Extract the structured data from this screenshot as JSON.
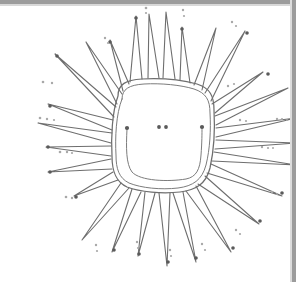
{
  "document": {
    "kind": "scanned-line-drawing",
    "title": "Spiky sun blob line drawing",
    "width": 299,
    "height": 282,
    "background_color": "#ffffff"
  },
  "edges": {
    "top_band_color": "#9c9c9c",
    "top_band_highlight": "#d8d8d8",
    "right_band_color": "#9c9c9c",
    "right_band_highlight": "#dcdcdc",
    "left_band": "none",
    "bottom_band": "none"
  },
  "ink": {
    "primary_color": "#6e6e6e",
    "secondary_color": "#7c7c7c",
    "dot_color": "#5a5a5a",
    "dot_faint_color": "#a8a8a8"
  },
  "drawing": {
    "subject": "sun-like spiky blob",
    "body": {
      "shape": "rounded square (squircle)",
      "outline_style": "double contour",
      "center_x": 155,
      "center_y": 140,
      "outer_path": "M 118 96 C 118 84, 126 80, 142 79 C 160 78, 182 80, 197 84 C 210 88, 214 96, 214 110 C 215 128, 214 150, 210 168 C 206 184, 196 190, 180 192 C 162 194, 140 192, 127 187 C 116 182, 112 172, 112 156 C 111 138, 112 112, 118 96 Z",
      "inner_path": "M 122 99 C 122 89, 129 85, 144 84 C 161 83, 181 85, 194 89 C 206 93, 210 100, 210 113 C 211 129, 210 149, 206 165 C 202 180, 193 186, 178 188 C 161 190, 141 188, 129 183 C 119 178, 116 169, 116 155 C 115 138, 116 114, 122 99 Z"
    },
    "inner_curve": {
      "description": "U-shaped mouth line with dotted terminals",
      "path": "M 127 129 C 126 148, 126 164, 132 172 C 140 181, 168 182, 186 179 C 196 177, 200 170, 201 155 C 202 142, 202 133, 202 128",
      "left_terminal": {
        "x": 127,
        "y": 128,
        "r": 2.1
      },
      "right_terminal": {
        "x": 202,
        "y": 127,
        "r": 2.1
      }
    },
    "center_dots": [
      {
        "x": 159,
        "y": 127,
        "r": 1.9
      },
      {
        "x": 166,
        "y": 127,
        "r": 1.9
      }
    ],
    "spike_count": 24,
    "spikes": [
      {
        "name": "spike-n-1",
        "base_a": [
          130,
          82
        ],
        "base_b": [
          142,
          79
        ],
        "tip": [
          136,
          16
        ]
      },
      {
        "name": "spike-n-2",
        "base_a": [
          148,
          78
        ],
        "base_b": [
          159,
          78
        ],
        "tip": [
          149,
          14
        ]
      },
      {
        "name": "spike-n-3",
        "base_a": [
          163,
          78
        ],
        "base_b": [
          175,
          79
        ],
        "tip": [
          166,
          12
        ]
      },
      {
        "name": "spike-ne-1",
        "base_a": [
          180,
          80
        ],
        "base_b": [
          190,
          83
        ],
        "tip": [
          182,
          27
        ]
      },
      {
        "name": "spike-ne-2",
        "base_a": [
          194,
          85
        ],
        "base_b": [
          202,
          90
        ],
        "tip": [
          216,
          28
        ]
      },
      {
        "name": "spike-ne-3",
        "base_a": [
          205,
          93
        ],
        "base_b": [
          211,
          101
        ],
        "tip": [
          245,
          31
        ]
      },
      {
        "name": "spike-ne-4",
        "base_a": [
          212,
          104
        ],
        "base_b": [
          215,
          113
        ],
        "tip": [
          263,
          72
        ]
      },
      {
        "name": "spike-e-1",
        "base_a": [
          215,
          116
        ],
        "base_b": [
          216,
          125
        ],
        "tip": [
          288,
          88
        ]
      },
      {
        "name": "spike-e-2",
        "base_a": [
          216,
          128
        ],
        "base_b": [
          216,
          137
        ],
        "tip": [
          296,
          118
        ]
      },
      {
        "name": "spike-e-3",
        "base_a": [
          216,
          140
        ],
        "base_b": [
          215,
          149
        ],
        "tip": [
          296,
          143
        ]
      },
      {
        "name": "spike-e-4",
        "base_a": [
          214,
          152
        ],
        "base_b": [
          212,
          161
        ],
        "tip": [
          296,
          165
        ]
      },
      {
        "name": "spike-se-1",
        "base_a": [
          211,
          164
        ],
        "base_b": [
          207,
          173
        ],
        "tip": [
          282,
          196
        ]
      },
      {
        "name": "spike-se-2",
        "base_a": [
          205,
          176
        ],
        "base_b": [
          198,
          184
        ],
        "tip": [
          259,
          224
        ]
      },
      {
        "name": "spike-se-3",
        "base_a": [
          196,
          186
        ],
        "base_b": [
          186,
          191
        ],
        "tip": [
          231,
          252
        ]
      },
      {
        "name": "spike-s-1",
        "base_a": [
          183,
          192
        ],
        "base_b": [
          173,
          193
        ],
        "tip": [
          196,
          262
        ]
      },
      {
        "name": "spike-s-2",
        "base_a": [
          170,
          193
        ],
        "base_b": [
          159,
          193
        ],
        "tip": [
          167,
          266
        ]
      },
      {
        "name": "spike-s-3",
        "base_a": [
          155,
          193
        ],
        "base_b": [
          145,
          192
        ],
        "tip": [
          138,
          256
        ]
      },
      {
        "name": "spike-sw-1",
        "base_a": [
          141,
          192
        ],
        "base_b": [
          132,
          189
        ],
        "tip": [
          112,
          252
        ]
      },
      {
        "name": "spike-sw-2",
        "base_a": [
          129,
          188
        ],
        "base_b": [
          121,
          183
        ],
        "tip": [
          82,
          240
        ]
      },
      {
        "name": "spike-sw-3",
        "base_a": [
          118,
          180
        ],
        "base_b": [
          113,
          172
        ],
        "tip": [
          74,
          196
        ]
      },
      {
        "name": "spike-w-1",
        "base_a": [
          112,
          169
        ],
        "base_b": [
          111,
          159
        ],
        "tip": [
          48,
          172
        ]
      },
      {
        "name": "spike-w-2",
        "base_a": [
          111,
          156
        ],
        "base_b": [
          111,
          146
        ],
        "tip": [
          46,
          147
        ]
      },
      {
        "name": "spike-w-3",
        "base_a": [
          111,
          143
        ],
        "base_b": [
          112,
          133
        ],
        "tip": [
          38,
          123
        ]
      },
      {
        "name": "spike-w-4",
        "base_a": [
          112,
          130
        ],
        "base_b": [
          113,
          120
        ],
        "tip": [
          48,
          104
        ]
      },
      {
        "name": "spike-nw-1",
        "base_a": [
          114,
          117
        ],
        "base_b": [
          116,
          107
        ],
        "tip": [
          55,
          54
        ]
      },
      {
        "name": "spike-nw-2",
        "base_a": [
          117,
          104
        ],
        "base_b": [
          122,
          94
        ],
        "tip": [
          86,
          42
        ]
      },
      {
        "name": "spike-nw-3",
        "base_a": [
          123,
          91
        ],
        "base_b": [
          129,
          84
        ],
        "tip": [
          110,
          40
        ]
      }
    ],
    "tip_dots": [
      {
        "x": 136,
        "y": 18,
        "r": 1.8
      },
      {
        "x": 182,
        "y": 29,
        "r": 1.8
      },
      {
        "x": 110,
        "y": 42,
        "r": 1.8
      },
      {
        "x": 57,
        "y": 56,
        "r": 1.8
      },
      {
        "x": 50,
        "y": 106,
        "r": 1.8
      },
      {
        "x": 48,
        "y": 147,
        "r": 1.8
      },
      {
        "x": 50,
        "y": 172,
        "r": 1.8
      },
      {
        "x": 76,
        "y": 197,
        "r": 1.8
      },
      {
        "x": 114,
        "y": 250,
        "r": 1.8
      },
      {
        "x": 139,
        "y": 254,
        "r": 1.8
      },
      {
        "x": 168,
        "y": 262,
        "r": 1.8
      },
      {
        "x": 196,
        "y": 258,
        "r": 1.8
      },
      {
        "x": 233,
        "y": 248,
        "r": 1.8
      },
      {
        "x": 260,
        "y": 221,
        "r": 1.8
      },
      {
        "x": 282,
        "y": 193,
        "r": 1.8
      },
      {
        "x": 268,
        "y": 74,
        "r": 1.8
      },
      {
        "x": 247,
        "y": 33,
        "r": 1.8
      }
    ],
    "scatter_dots": [
      {
        "x": 146,
        "y": 8,
        "r": 1.3
      },
      {
        "x": 146,
        "y": 13,
        "r": 1.1
      },
      {
        "x": 183,
        "y": 10,
        "r": 1.2
      },
      {
        "x": 184,
        "y": 16,
        "r": 1.1
      },
      {
        "x": 105,
        "y": 38,
        "r": 1.2
      },
      {
        "x": 108,
        "y": 43,
        "r": 1.1
      },
      {
        "x": 232,
        "y": 22,
        "r": 1.2
      },
      {
        "x": 236,
        "y": 26,
        "r": 1.1
      },
      {
        "x": 43,
        "y": 82,
        "r": 1.3
      },
      {
        "x": 52,
        "y": 83,
        "r": 1.2
      },
      {
        "x": 40,
        "y": 118,
        "r": 1.3
      },
      {
        "x": 47,
        "y": 119,
        "r": 1.2
      },
      {
        "x": 54,
        "y": 120,
        "r": 1.1
      },
      {
        "x": 60,
        "y": 152,
        "r": 1.3
      },
      {
        "x": 67,
        "y": 152,
        "r": 1.2
      },
      {
        "x": 72,
        "y": 153,
        "r": 1.1
      },
      {
        "x": 66,
        "y": 197,
        "r": 1.3
      },
      {
        "x": 72,
        "y": 198,
        "r": 1.2
      },
      {
        "x": 96,
        "y": 245,
        "r": 1.2
      },
      {
        "x": 97,
        "y": 251,
        "r": 1.1
      },
      {
        "x": 137,
        "y": 242,
        "r": 1.2
      },
      {
        "x": 138,
        "y": 248,
        "r": 1.1
      },
      {
        "x": 170,
        "y": 250,
        "r": 1.2
      },
      {
        "x": 171,
        "y": 256,
        "r": 1.1
      },
      {
        "x": 202,
        "y": 244,
        "r": 1.2
      },
      {
        "x": 205,
        "y": 250,
        "r": 1.1
      },
      {
        "x": 236,
        "y": 230,
        "r": 1.2
      },
      {
        "x": 240,
        "y": 234,
        "r": 1.1
      },
      {
        "x": 272,
        "y": 192,
        "r": 1.2
      },
      {
        "x": 277,
        "y": 194,
        "r": 1.1
      },
      {
        "x": 277,
        "y": 119,
        "r": 1.2
      },
      {
        "x": 282,
        "y": 119,
        "r": 1.1
      },
      {
        "x": 287,
        "y": 120,
        "r": 1.0
      },
      {
        "x": 262,
        "y": 147,
        "r": 1.2
      },
      {
        "x": 268,
        "y": 148,
        "r": 1.1
      },
      {
        "x": 273,
        "y": 148,
        "r": 1.0
      },
      {
        "x": 240,
        "y": 120,
        "r": 1.2
      },
      {
        "x": 246,
        "y": 121,
        "r": 1.1
      },
      {
        "x": 228,
        "y": 86,
        "r": 1.2
      },
      {
        "x": 234,
        "y": 84,
        "r": 1.1
      }
    ]
  }
}
